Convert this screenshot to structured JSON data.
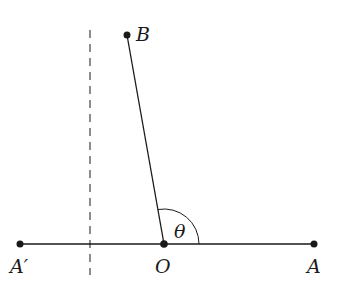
{
  "diagram": {
    "points": {
      "A_prime": {
        "label": "A′",
        "x": 20,
        "y": 244
      },
      "O": {
        "label": "O",
        "x": 164,
        "y": 244
      },
      "A": {
        "label": "A",
        "x": 314,
        "y": 244
      },
      "B": {
        "label": "B",
        "x": 127,
        "y": 35
      }
    },
    "angle_label": "θ",
    "colors": {
      "ink": "#1a1a1a",
      "background": "#ffffff"
    }
  }
}
